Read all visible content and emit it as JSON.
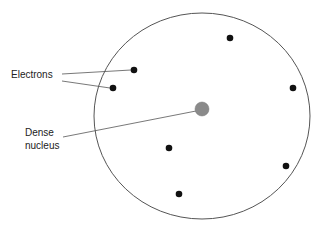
{
  "diagram": {
    "title": "",
    "labels": {
      "electrons": "Electrons",
      "nucleus_line1": "Dense",
      "nucleus_line2": "nucleus"
    },
    "atom": {
      "cx": 202,
      "cy": 116,
      "rx": 108,
      "ry": 103,
      "stroke": "#555555"
    },
    "nucleus": {
      "cx": 202,
      "cy": 109,
      "r": 7,
      "fill": "#8a8a8a"
    },
    "electrons": [
      {
        "cx": 230,
        "cy": 38
      },
      {
        "cx": 134,
        "cy": 70
      },
      {
        "cx": 113,
        "cy": 88
      },
      {
        "cx": 293,
        "cy": 88
      },
      {
        "cx": 169,
        "cy": 148
      },
      {
        "cx": 286,
        "cy": 166
      },
      {
        "cx": 179,
        "cy": 194
      }
    ],
    "electron_color": "#111111"
  }
}
